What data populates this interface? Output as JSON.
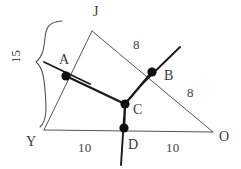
{
  "figure": {
    "kind": "geometry-diagram",
    "width": 241,
    "height": 169,
    "background_color": "#ffffff",
    "stroke_color_thin": "#555555",
    "stroke_color_thick": "#1a1a1a",
    "point_fill_color": "#111111",
    "text_color": "#3a3a3a"
  },
  "points": {
    "J": {
      "label": "J",
      "x": 92,
      "y": 31,
      "label_x": 93,
      "label_y": 5,
      "marked": false
    },
    "Y": {
      "label": "Y",
      "x": 44,
      "y": 130,
      "label_x": 26,
      "label_y": 135,
      "marked": false
    },
    "O": {
      "label": "O",
      "x": 213,
      "y": 132,
      "label_x": 219,
      "label_y": 130,
      "marked": false
    },
    "A": {
      "label": "A",
      "x": 66,
      "y": 76,
      "label_x": 59,
      "label_y": 53,
      "marked": true
    },
    "B": {
      "label": "B",
      "x": 152,
      "y": 72,
      "label_x": 164,
      "label_y": 69,
      "marked": true
    },
    "C": {
      "label": "C",
      "x": 125,
      "y": 104,
      "label_x": 133,
      "label_y": 103,
      "marked": true
    },
    "D": {
      "label": "D",
      "x": 124,
      "y": 128,
      "label_x": 128,
      "label_y": 138,
      "marked": true
    }
  },
  "segments": {
    "triangle": [
      {
        "name": "J-Y",
        "from": "J",
        "to": "Y",
        "weight": "thin"
      },
      {
        "name": "J-O",
        "from": "J",
        "to": "O",
        "weight": "thin"
      },
      {
        "name": "Y-O",
        "from": "Y",
        "to": "O",
        "weight": "thin"
      }
    ],
    "path": [
      {
        "name": "A-C",
        "from": "A",
        "to": "C",
        "weight": "thick"
      },
      {
        "name": "C-B",
        "from": "C",
        "to": "B",
        "weight": "thick"
      },
      {
        "name": "C-D",
        "from": "C",
        "to": "D",
        "weight": "thick"
      }
    ],
    "bisector_rays": [
      {
        "name": "ray-through-A",
        "x1": 44,
        "y1": 62,
        "x2": 90,
        "y2": 84,
        "weight": "thick"
      },
      {
        "name": "ray-through-B",
        "x1": 180,
        "y1": 47,
        "x2": 141,
        "y2": 85,
        "weight": "thick"
      },
      {
        "name": "ray-through-D",
        "x1": 124,
        "y1": 118,
        "x2": 121,
        "y2": 165,
        "weight": "thick"
      }
    ]
  },
  "labels": {
    "measure_jb": {
      "text": "8",
      "x": 133,
      "y": 38
    },
    "measure_bo": {
      "text": "8",
      "x": 187,
      "y": 86
    },
    "measure_yd": {
      "text": "10",
      "x": 78,
      "y": 141
    },
    "measure_do": {
      "text": "10",
      "x": 166,
      "y": 141
    },
    "measure_ja": {
      "text": "15",
      "x": 9,
      "y": 50
    }
  },
  "brace": {
    "name": "left-brace-15",
    "measure": "15",
    "top_y": 20,
    "bottom_y": 128,
    "tip_x": 30,
    "tip_y": 63,
    "body_x": 46
  }
}
